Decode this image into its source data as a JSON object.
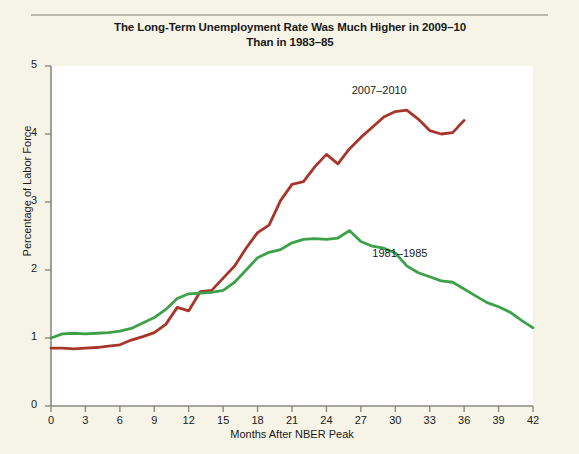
{
  "figure": {
    "title_line1": "The Long-Term Unemployment Rate Was Much Higher in 2009–10",
    "title_line2": "Than in 1983–85",
    "background_color": "#f6f3e7",
    "plot_background_color": "#ffffff",
    "axis_color": "#8b8880"
  },
  "chart_data": {
    "type": "line",
    "title": "The Long-Term Unemployment Rate Was Much Higher in 2009–10 Than in 1983–85",
    "xlabel": "Months After NBER Peak",
    "ylabel": "Percentage of Labor Force",
    "xlim": [
      0,
      42
    ],
    "ylim": [
      0,
      5
    ],
    "grid": false,
    "legend_position": "inline-annotation",
    "xticks": [
      0,
      3,
      6,
      9,
      12,
      15,
      18,
      21,
      24,
      27,
      30,
      33,
      36,
      39,
      42
    ],
    "xtick_labels": [
      "0",
      "3",
      "6",
      "9",
      "12",
      "15",
      "18",
      "21",
      "24",
      "27",
      "30",
      "33",
      "36",
      "39",
      "42"
    ],
    "yticks": [
      0,
      1,
      2,
      3,
      4,
      5
    ],
    "ytick_labels": [
      "0",
      "1",
      "2",
      "3",
      "4",
      "5"
    ],
    "series": [
      {
        "name": "2007–2010",
        "color": "#a8352a",
        "label_x": 26.2,
        "label_y": 4.62,
        "x": [
          0,
          1,
          2,
          3,
          4,
          5,
          6,
          7,
          8,
          9,
          10,
          11,
          12,
          13,
          14,
          15,
          16,
          17,
          18,
          19,
          20,
          21,
          22,
          23,
          24,
          25,
          26,
          27,
          28,
          29,
          30,
          31,
          32,
          33,
          34,
          35,
          36
        ],
        "values": [
          0.85,
          0.85,
          0.84,
          0.85,
          0.86,
          0.88,
          0.9,
          0.97,
          1.02,
          1.08,
          1.2,
          1.45,
          1.4,
          1.68,
          1.7,
          1.88,
          2.06,
          2.32,
          2.55,
          2.66,
          3.02,
          3.26,
          3.3,
          3.52,
          3.7,
          3.56,
          3.78,
          3.95,
          4.1,
          4.25,
          4.33,
          4.35,
          4.22,
          4.05,
          4.0,
          4.02,
          4.2
        ]
      },
      {
        "name": "1981–1985",
        "color": "#3da14a",
        "label_x": 28.0,
        "label_y": 2.22,
        "x": [
          0,
          1,
          2,
          3,
          4,
          5,
          6,
          7,
          8,
          9,
          10,
          11,
          12,
          13,
          14,
          15,
          16,
          17,
          18,
          19,
          20,
          21,
          22,
          23,
          24,
          25,
          26,
          27,
          28,
          29,
          30,
          31,
          32,
          33,
          34,
          35,
          36,
          37,
          38,
          39,
          40,
          41,
          42
        ],
        "values": [
          1.0,
          1.06,
          1.07,
          1.06,
          1.07,
          1.08,
          1.1,
          1.14,
          1.22,
          1.3,
          1.42,
          1.58,
          1.65,
          1.66,
          1.67,
          1.7,
          1.82,
          2.0,
          2.18,
          2.26,
          2.3,
          2.4,
          2.45,
          2.46,
          2.45,
          2.47,
          2.58,
          2.42,
          2.35,
          2.32,
          2.25,
          2.06,
          1.96,
          1.9,
          1.84,
          1.82,
          1.72,
          1.62,
          1.52,
          1.46,
          1.38,
          1.26,
          1.15
        ]
      }
    ]
  }
}
